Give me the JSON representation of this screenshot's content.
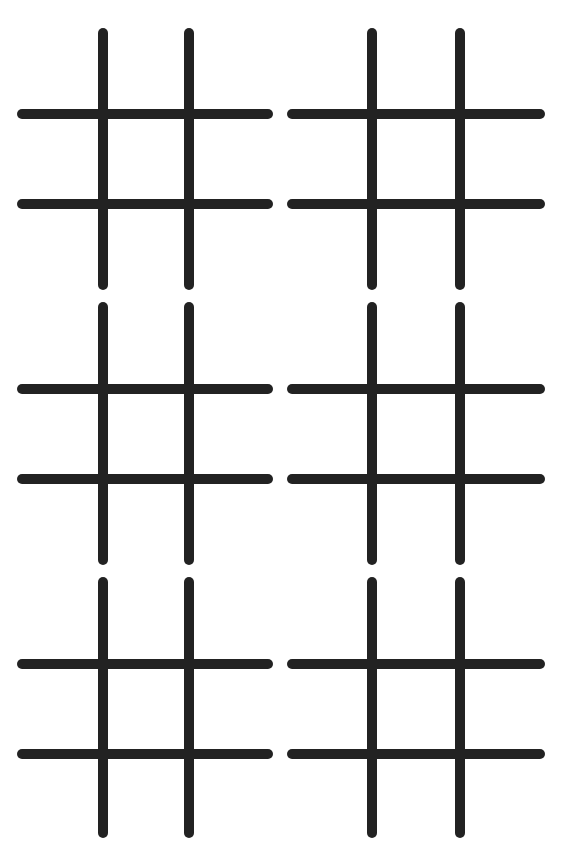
{
  "page": {
    "background_color": "#ffffff",
    "line_color": "#222222"
  },
  "watermark": {
    "bottom_text": "BACK-OF-PAGE BLEED-THROUGH TEXT (ILLEGIBLE)"
  },
  "boards": [
    {
      "id": 1,
      "row": 1,
      "col": 1,
      "cells": [
        "",
        "",
        "",
        "",
        "",
        "",
        "",
        "",
        ""
      ]
    },
    {
      "id": 2,
      "row": 1,
      "col": 2,
      "cells": [
        "",
        "",
        "",
        "",
        "",
        "",
        "",
        "",
        ""
      ]
    },
    {
      "id": 3,
      "row": 2,
      "col": 1,
      "cells": [
        "",
        "",
        "",
        "",
        "",
        "",
        "",
        "",
        ""
      ]
    },
    {
      "id": 4,
      "row": 2,
      "col": 2,
      "cells": [
        "",
        "",
        "",
        "",
        "",
        "",
        "",
        "",
        ""
      ]
    },
    {
      "id": 5,
      "row": 3,
      "col": 1,
      "cells": [
        "",
        "",
        "",
        "",
        "",
        "",
        "",
        "",
        ""
      ]
    },
    {
      "id": 6,
      "row": 3,
      "col": 2,
      "cells": [
        "",
        "",
        "",
        "",
        "",
        "",
        "",
        "",
        ""
      ]
    }
  ]
}
